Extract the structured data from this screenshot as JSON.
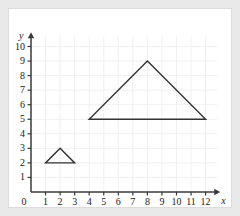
{
  "figure": {
    "background_color": "#e9e9e9",
    "panel_color": "#ffffff",
    "panel_border_color": "#dcdcdc",
    "grid_color": "#f0f0f0",
    "axis_color": "#3a3a3a",
    "shape_color": "#333333"
  },
  "chart_data": {
    "type": "scatter",
    "title": "",
    "xlabel": "x",
    "ylabel": "y",
    "xlim": [
      0,
      12.8
    ],
    "ylim": [
      0,
      10.7
    ],
    "grid": true,
    "legend": null,
    "x_ticks": [
      0,
      1,
      2,
      3,
      4,
      5,
      6,
      7,
      8,
      9,
      10,
      11,
      12
    ],
    "x_tick_labels": [
      "0",
      "1",
      "2",
      "3",
      "4",
      "5",
      "6",
      "7",
      "8",
      "9",
      "10",
      "11",
      "12"
    ],
    "y_ticks": [
      0,
      1,
      2,
      3,
      4,
      5,
      6,
      7,
      8,
      9,
      10
    ],
    "y_tick_labels": [
      "0",
      "1",
      "2",
      "3",
      "4",
      "5",
      "6",
      "7",
      "8",
      "9",
      "10"
    ],
    "origin_label": "0",
    "shapes": [
      {
        "name": "small-triangle",
        "type": "polygon",
        "vertices": [
          [
            1,
            2
          ],
          [
            3,
            2
          ],
          [
            2,
            3
          ]
        ],
        "base_length": 2,
        "height": 1,
        "fill": "none",
        "stroke": "#333333",
        "stroke_width": 1.4
      },
      {
        "name": "large-triangle",
        "type": "polygon",
        "vertices": [
          [
            4,
            5
          ],
          [
            12,
            5
          ],
          [
            8,
            9
          ]
        ],
        "base_length": 8,
        "height": 4,
        "fill": "none",
        "stroke": "#333333",
        "stroke_width": 1.4
      }
    ]
  }
}
